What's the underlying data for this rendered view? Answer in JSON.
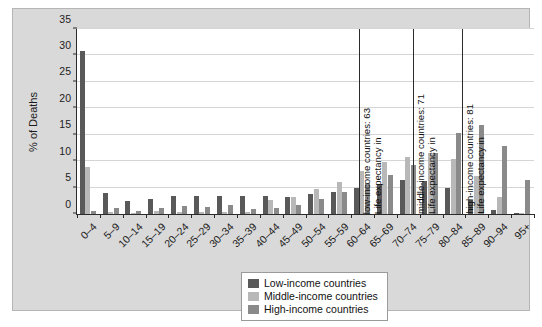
{
  "chart_data": {
    "type": "bar",
    "title": "",
    "xlabel": "",
    "ylabel": "% of Deaths",
    "ylim": [
      0,
      35
    ],
    "yticks": [
      0,
      5,
      10,
      15,
      20,
      25,
      30,
      35
    ],
    "grid": true,
    "legend_position": "bottom-center",
    "categories": [
      "0–4",
      "5–9",
      "10–14",
      "15–19",
      "20–24",
      "25–29",
      "30–34",
      "35–39",
      "40–44",
      "45–49",
      "50–54",
      "55–59",
      "60–64",
      "65–69",
      "70–74",
      "75–79",
      "80–84",
      "85–89",
      "90–94",
      "95+"
    ],
    "series": [
      {
        "name": "Low-income countries",
        "color": "#595959",
        "values": [
          30.9,
          3.9,
          2.4,
          2.9,
          3.4,
          3.4,
          3.4,
          3.4,
          3.4,
          3.3,
          3.7,
          4.1,
          4.9,
          5.6,
          6.4,
          6.3,
          4.9,
          2.7,
          0.8,
          0.1
        ]
      },
      {
        "name": "Middle-income countries",
        "color": "#b8b8b8",
        "values": [
          8.9,
          0.3,
          0.2,
          0.5,
          0.4,
          0.3,
          0.3,
          0.3,
          2.6,
          3.2,
          4.8,
          6.1,
          8.1,
          9.9,
          10.7,
          11.5,
          10.5,
          7.2,
          3.3,
          0.2
        ]
      },
      {
        "name": "High-income countries",
        "color": "#8a8a8a",
        "values": [
          0.6,
          1.1,
          0.6,
          1.2,
          1.5,
          1.4,
          1.7,
          1.0,
          1.1,
          1.8,
          2.9,
          4.2,
          5.8,
          7.4,
          9.2,
          11.6,
          15.3,
          16.8,
          12.8,
          6.4
        ]
      }
    ],
    "annotations": [
      {
        "id": "low-income-life-expectancy",
        "value": 63,
        "line1": "Life expectancy in",
        "line2": "low-income countries: 63",
        "x_percent": 61.6
      },
      {
        "id": "middle-income-life-expectancy",
        "value": 71,
        "line1": "Life expectancy in",
        "line2": "middle-income countries: 71",
        "x_percent": 73.6
      },
      {
        "id": "high-income-life-expectancy",
        "value": 81,
        "line1": "Life expectancy in",
        "line2": "high-income countries: 81",
        "x_percent": 84.3
      }
    ]
  },
  "legend": {
    "items": [
      {
        "label": "Low-income countries",
        "key": "low"
      },
      {
        "label": "Middle-income countries",
        "key": "middle"
      },
      {
        "label": "High-income countries",
        "key": "high"
      }
    ]
  },
  "colors": {
    "low": "#595959",
    "middle": "#b8b8b8",
    "high": "#8a8a8a",
    "plate": "#d9d9d9",
    "plot_background": "#ffffff",
    "axis": "#2b2b2b",
    "gridline": "#d5d5d5"
  }
}
